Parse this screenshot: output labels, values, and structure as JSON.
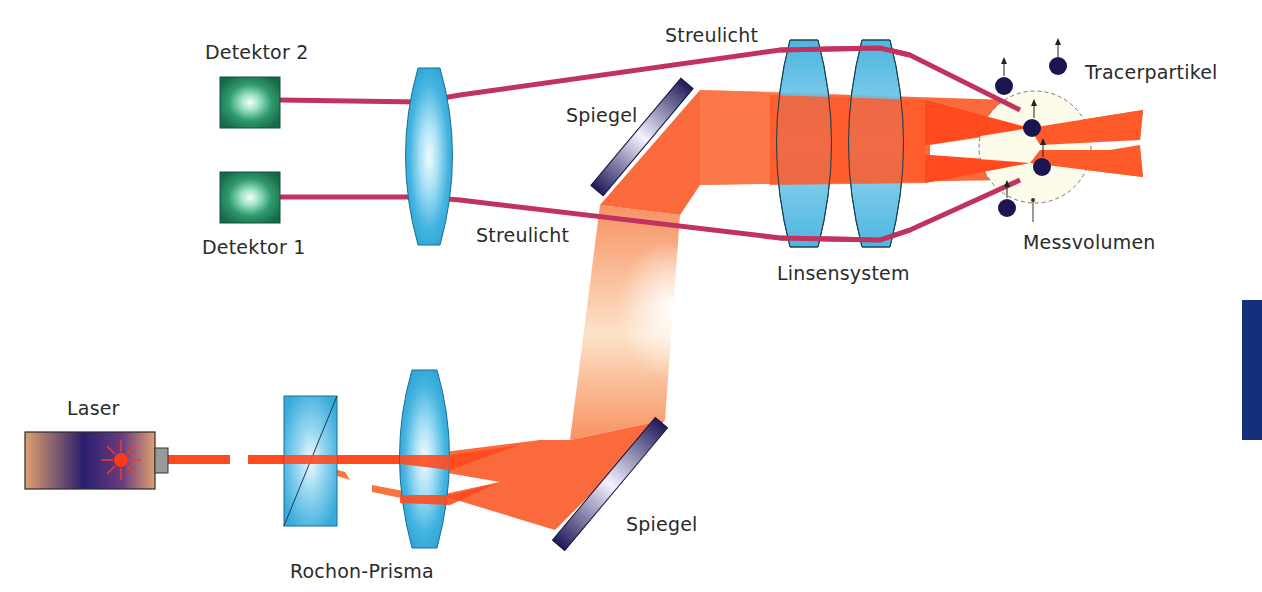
{
  "diagram": {
    "labels": {
      "detektor2": "Detektor 2",
      "detektor1": "Detektor 1",
      "streulicht_top": "Streulicht",
      "streulicht_bottom": "Streulicht",
      "spiegel_top": "Spiegel",
      "spiegel_bottom": "Spiegel",
      "linsensystem": "Linsensystem",
      "tracerpartikel": "Tracerpartikel",
      "messvolumen": "Messvolumen",
      "laser": "Laser",
      "rochon_prisma": "Rochon-Prisma"
    },
    "colors": {
      "laser_beam": "#ff4a1f",
      "beam_light": "#f7a06e",
      "scatter_line": "#c2325f",
      "lens_blue": "#3aaedc",
      "detector_green": "#1e7a55",
      "mirror_navy": "#232060",
      "particle_navy": "#1c1550",
      "side_tab": "#14307a"
    }
  }
}
